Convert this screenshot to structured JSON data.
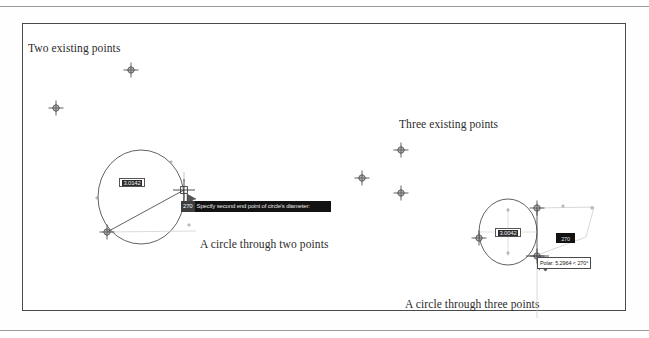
{
  "figure": {
    "captions": [
      {
        "id": "two-existing-points",
        "text": "Two existing points",
        "x": 28,
        "y": 42
      },
      {
        "id": "three-existing-points",
        "text": "Three existing points",
        "x": 399,
        "y": 118
      },
      {
        "id": "circle-through-two-points",
        "text": "A circle through two points",
        "x": 200,
        "y": 238
      },
      {
        "id": "circle-through-three-points",
        "text": "A circle through three points",
        "x": 405,
        "y": 298
      }
    ]
  },
  "left_panel": {
    "existing_points": [
      {
        "label": "point-1",
        "x": 131,
        "y": 70
      },
      {
        "label": "point-2",
        "x": 56,
        "y": 108
      }
    ],
    "circle": {
      "cx": 141,
      "cy": 197,
      "rx": 43,
      "ry": 47
    },
    "diameter": {
      "x1": 107,
      "y1": 232,
      "x2": 184,
      "y2": 190
    },
    "node_markers": [
      {
        "label": "diameter-start-node",
        "x": 107,
        "y": 232
      },
      {
        "label": "diameter-end-node",
        "x": 184,
        "y": 190
      }
    ],
    "tick_marks": [
      {
        "x": 171,
        "y": 162
      },
      {
        "x": 97,
        "y": 198
      },
      {
        "x": 189,
        "y": 225
      },
      {
        "x": 142,
        "y": 158
      }
    ],
    "dimension_box": {
      "value": "3.0142",
      "x": 119,
      "y": 178
    },
    "command_tooltip": {
      "field_value": "270",
      "prompt": "Specify second end point of circle's diameter:",
      "x": 181,
      "y": 201,
      "width": 150,
      "height": 11
    },
    "cursor": {
      "x": 184,
      "y": 190
    }
  },
  "right_panel": {
    "existing_points": [
      {
        "label": "point-1",
        "x": 362,
        "y": 178
      },
      {
        "label": "point-2",
        "x": 401,
        "y": 150
      },
      {
        "label": "point-3",
        "x": 401,
        "y": 193
      }
    ],
    "circle": {
      "cx": 508,
      "cy": 232,
      "rx": 29,
      "ry": 33
    },
    "node_markers": [
      {
        "label": "node-left",
        "x": 479,
        "y": 238
      },
      {
        "label": "node-top",
        "x": 537,
        "y": 208
      },
      {
        "label": "node-bottom",
        "x": 537,
        "y": 256
      }
    ],
    "tick_marks": [
      {
        "x": 508,
        "y": 210
      },
      {
        "x": 508,
        "y": 253
      },
      {
        "x": 563,
        "y": 206
      },
      {
        "x": 592,
        "y": 208
      }
    ],
    "dimension_box": {
      "value": "3.0042",
      "x": 495,
      "y": 228
    },
    "mini_tooltip": {
      "text": "270",
      "x": 556,
      "y": 233,
      "width": 19,
      "height": 10
    },
    "polar_tooltip": {
      "text": "Polar: 5.2964 < 270°",
      "x": 537,
      "y": 257
    },
    "cursor": {
      "x": 537,
      "y": 256
    },
    "tracking_line": {
      "x1": 537,
      "y1": 208,
      "x2": 537,
      "y2": 318
    }
  },
  "colors": {
    "page_background": "#ffffff",
    "figure_border": "#4a4a4a",
    "scan_rule": "#9a9a9a",
    "geometry_stroke": "#3a3a3a",
    "tracking_stroke": "#b4b4b4",
    "tooltip_background": "#121212",
    "tooltip_text": "#e8e8e8",
    "caption_text": "#2b2b2b"
  }
}
